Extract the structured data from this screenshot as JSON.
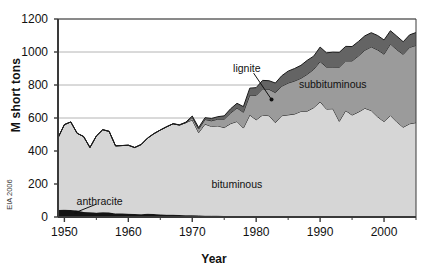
{
  "chart_data": {
    "type": "area",
    "stacked": true,
    "title": "",
    "xlabel": "Year",
    "ylabel": "M short tons",
    "source_note": "EIA 2006",
    "xlim": [
      1949,
      2005
    ],
    "ylim": [
      0,
      1200
    ],
    "yticks": [
      0,
      200,
      400,
      600,
      800,
      1000,
      1200
    ],
    "xticks": [
      1950,
      1960,
      1970,
      1980,
      1990,
      2000
    ],
    "grid": "horizontal",
    "legend_position": "inline-annotations",
    "colors": {
      "anthracite": "#141414",
      "bituminous": "#d6d6d6",
      "subbituminous": "#9b9b9b",
      "lignite": "#646464",
      "axis": "#3a3a3a",
      "gridline": "#b4b4b4",
      "outline": "#1a1a1a"
    },
    "annotations": [
      {
        "label": "anthracite",
        "x": 1955.5,
        "y": 90,
        "has_leader": true
      },
      {
        "label": "bituminous",
        "x": 1977,
        "y": 195,
        "has_leader": false
      },
      {
        "label": "lignite",
        "x": 1978.5,
        "y": 900,
        "has_leader": true
      },
      {
        "label": "subbituminous",
        "x": 1992,
        "y": 800,
        "has_leader": false
      }
    ],
    "x": [
      1949,
      1950,
      1951,
      1952,
      1953,
      1954,
      1955,
      1956,
      1957,
      1958,
      1959,
      1960,
      1961,
      1962,
      1963,
      1964,
      1965,
      1966,
      1967,
      1968,
      1969,
      1970,
      1971,
      1972,
      1973,
      1974,
      1975,
      1976,
      1977,
      1978,
      1979,
      1980,
      1981,
      1982,
      1983,
      1984,
      1985,
      1986,
      1987,
      1988,
      1989,
      1990,
      1991,
      1992,
      1993,
      1994,
      1995,
      1996,
      1997,
      1998,
      1999,
      2000,
      2001,
      2002,
      2003,
      2004,
      2005
    ],
    "series": [
      {
        "name": "anthracite",
        "values": [
          43,
          44,
          42,
          40,
          31,
          29,
          26,
          29,
          27,
          21,
          21,
          19,
          18,
          17,
          19,
          18,
          15,
          13,
          13,
          12,
          11,
          10,
          9,
          7,
          7,
          7,
          6,
          6,
          6,
          5,
          5,
          6,
          5,
          4,
          4,
          4,
          5,
          4,
          4,
          4,
          3,
          4,
          3,
          5,
          4,
          5,
          5,
          5,
          5,
          5,
          5,
          4,
          4,
          4,
          3,
          2,
          2
        ]
      },
      {
        "name": "bituminous",
        "values": [
          437,
          516,
          534,
          467,
          457,
          392,
          465,
          500,
          492,
          410,
          412,
          416,
          403,
          422,
          459,
          487,
          512,
          534,
          552,
          545,
          561,
          578,
          502,
          556,
          542,
          545,
          536,
          560,
          573,
          534,
          613,
          583,
          613,
          610,
          568,
          610,
          614,
          620,
          636,
          638,
          660,
          694,
          651,
          651,
          576,
          640,
          613,
          631,
          654,
          640,
          602,
          574,
          611,
          572,
          541,
          563,
          570
        ]
      },
      {
        "name": "subbituminous",
        "values": [
          0,
          0,
          0,
          0,
          0,
          0,
          0,
          0,
          0,
          0,
          0,
          0,
          0,
          0,
          0,
          0,
          0,
          0,
          0,
          0,
          0,
          16,
          22,
          28,
          34,
          41,
          51,
          64,
          82,
          96,
          121,
          148,
          159,
          160,
          182,
          179,
          193,
          200,
          201,
          223,
          232,
          244,
          255,
          253,
          328,
          301,
          328,
          340,
          352,
          386,
          406,
          409,
          434,
          438,
          442,
          463,
          468
        ]
      },
      {
        "name": "lignite",
        "values": [
          0,
          0,
          0,
          0,
          0,
          0,
          0,
          0,
          0,
          0,
          0,
          0,
          0,
          0,
          0,
          0,
          0,
          0,
          0,
          2,
          3,
          8,
          9,
          11,
          14,
          15,
          20,
          26,
          28,
          34,
          42,
          47,
          51,
          52,
          58,
          63,
          72,
          76,
          78,
          85,
          80,
          88,
          86,
          90,
          90,
          88,
          87,
          88,
          87,
          86,
          87,
          86,
          80,
          82,
          76,
          76,
          78
        ]
      }
    ]
  }
}
